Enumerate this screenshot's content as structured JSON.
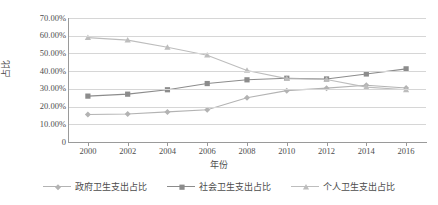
{
  "chart_data": {
    "type": "line",
    "title": "",
    "xlabel": "年份",
    "ylabel": "占比",
    "categories": [
      "2000",
      "2002",
      "2004",
      "2006",
      "2008",
      "2010",
      "2012",
      "2014",
      "2016"
    ],
    "ytick_labels": [
      "0",
      "10.00%",
      "20.00%",
      "30.00%",
      "40.00%",
      "50.00%",
      "60.00%",
      "70.00%"
    ],
    "ytick_values": [
      0,
      10,
      20,
      30,
      40,
      50,
      60,
      70
    ],
    "ylim": [
      0,
      70
    ],
    "grid": "horizontal",
    "legend_position": "bottom",
    "series": [
      {
        "name": "政府卫生支出占比",
        "marker": "diamond",
        "color": "#b3b3b3",
        "values": [
          15.5,
          15.8,
          17.0,
          18.2,
          25.0,
          29.0,
          30.4,
          32.0,
          30.5
        ]
      },
      {
        "name": "社会卫生支出占比",
        "marker": "square",
        "color": "#8c8c8c",
        "values": [
          25.9,
          27.0,
          29.5,
          33.0,
          35.1,
          36.0,
          35.6,
          38.4,
          41.3
        ]
      },
      {
        "name": "个人卫生支出占比",
        "marker": "triangle",
        "color": "#bdbdbd",
        "values": [
          58.9,
          57.5,
          53.5,
          49.0,
          40.4,
          35.8,
          35.3,
          31.0,
          29.5
        ]
      }
    ]
  },
  "colors": {
    "axis": "#9a9a9a",
    "grid": "#d6d6d6",
    "text": "#4d4d4d",
    "background": "#ffffff"
  }
}
